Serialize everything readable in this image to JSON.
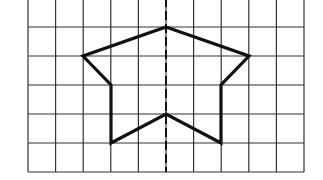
{
  "diagram": {
    "type": "symmetry-grid",
    "grid": {
      "left": 28,
      "right": 304,
      "top": -2,
      "bottom": 172,
      "columns": 10,
      "rows": 6,
      "vlines": [
        28,
        55.6,
        83.2,
        110.8,
        138.4,
        166,
        193.6,
        221.2,
        248.8,
        276.4,
        304
      ],
      "hlines": [
        27,
        56,
        85,
        114,
        143,
        172
      ],
      "line_color": "#333333"
    },
    "axis": {
      "x": 166,
      "style": "dashed",
      "color": "#111111"
    },
    "shape": {
      "stroke": "#111111",
      "points": [
        [
          166,
          27
        ],
        [
          249,
          56
        ],
        [
          221,
          85
        ],
        [
          221,
          143
        ],
        [
          166,
          114
        ],
        [
          111,
          143
        ],
        [
          111,
          85
        ],
        [
          83,
          56
        ]
      ]
    }
  }
}
